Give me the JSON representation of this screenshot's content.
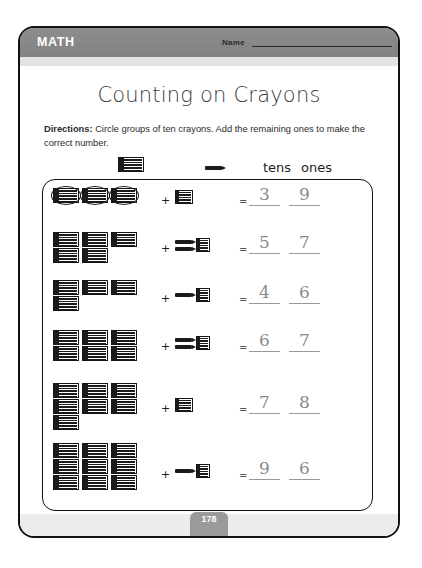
{
  "header": {
    "subject": "MATH",
    "name_label": "Name"
  },
  "title": "Counting on Crayons",
  "directions": {
    "label": "Directions:",
    "text": " Circle groups of ten crayons. Add the remaining ones to make the correct number."
  },
  "key": {
    "bundle_icon": "crayon-bundle-icon",
    "single_icon": "single-crayon-icon",
    "tens_label": "tens",
    "ones_label": "ones"
  },
  "plus_symbol": "+",
  "equals_symbol": "=",
  "problems": [
    {
      "row": 1,
      "tens_rows": [
        3
      ],
      "circled": true,
      "ones_singles": 0,
      "ones_blocks": 1,
      "tens_answer": "3",
      "ones_answer": "9"
    },
    {
      "row": 2,
      "tens_rows": [
        3,
        2
      ],
      "circled": false,
      "ones_singles": 2,
      "ones_blocks": 1,
      "tens_answer": "5",
      "ones_answer": "7"
    },
    {
      "row": 3,
      "tens_rows": [
        3,
        1
      ],
      "circled": false,
      "ones_singles": 1,
      "ones_blocks": 1,
      "tens_answer": "4",
      "ones_answer": "6"
    },
    {
      "row": 4,
      "tens_rows": [
        3,
        3
      ],
      "circled": false,
      "ones_singles": 2,
      "ones_blocks": 1,
      "tens_answer": "6",
      "ones_answer": "7"
    },
    {
      "row": 5,
      "tens_rows": [
        3,
        3,
        1
      ],
      "circled": false,
      "ones_singles": 0,
      "ones_blocks": 1,
      "tens_answer": "7",
      "ones_answer": "8"
    },
    {
      "row": 6,
      "tens_rows": [
        3,
        3,
        3
      ],
      "circled": false,
      "ones_singles": 1,
      "ones_blocks": 1,
      "tens_answer": "9",
      "ones_answer": "6"
    }
  ],
  "bottom_equations": [
    {
      "expression": "6 + 6 =",
      "answer": "12"
    },
    {
      "expression": "8 + 4 =",
      "answer": "12"
    },
    {
      "expression": "9 + 5 =",
      "answer": "14"
    }
  ],
  "page_number": "178",
  "colors": {
    "header_band": "#8a8a8a",
    "ink": "#1b1b1b",
    "handwriting": "#8a8a8a"
  }
}
